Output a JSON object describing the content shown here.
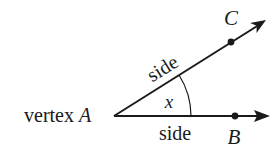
{
  "diagram": {
    "type": "angle",
    "labels": {
      "vertex_prefix": "vertex",
      "vertex_point": "A",
      "upper_side": "side",
      "lower_side": "side",
      "angle": "x",
      "point_upper": "C",
      "point_lower": "B"
    },
    "colors": {
      "stroke": "#1a1a1a",
      "background": "#ffffff"
    },
    "geometry": {
      "vertex": [
        114,
        116
      ],
      "ray_upper_end": [
        266,
        20
      ],
      "ray_lower_end": [
        270,
        116
      ],
      "point_C": [
        231,
        42
      ],
      "point_B": [
        235,
        116
      ],
      "arc_radius": 77
    }
  }
}
